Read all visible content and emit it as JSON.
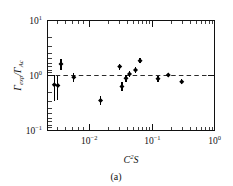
{
  "figure": {
    "caption": "(a)",
    "background_color": "#ffffff",
    "marker_color": "#000000",
    "reference_line_color": "#2b2b2b"
  },
  "chart_data": {
    "type": "scatter",
    "title": "",
    "subtitle": "",
    "xlabel": "C²S",
    "xlabel_parts": {
      "base": "C",
      "sup": "2",
      "tail": "S"
    },
    "ylabel": "Γexp/ΓAc",
    "ylabel_parts": {
      "num_base": "Γ",
      "num_sub": "exp",
      "sep": "/",
      "den_base": "Γ",
      "den_sub": "Ac"
    },
    "xscale": "log",
    "yscale": "log",
    "xlim": [
      0.003,
      1.0
    ],
    "ylim": [
      0.1,
      10.0
    ],
    "grid": false,
    "legend": null,
    "xticks": [
      0.01,
      0.1,
      1.0
    ],
    "xtick_labels": [
      "10-2",
      "10-1",
      "100"
    ],
    "xtick_label_parts": [
      {
        "base": "10",
        "exp": "−2"
      },
      {
        "base": "10",
        "exp": "−1"
      },
      {
        "base": "10",
        "exp": "0"
      }
    ],
    "yticks": [
      0.1,
      1.0,
      10.0
    ],
    "ytick_labels": [
      "10-1",
      "100",
      "101"
    ],
    "ytick_label_parts": [
      {
        "base": "10",
        "exp": "−1"
      },
      {
        "base": "10",
        "exp": "0"
      },
      {
        "base": "10",
        "exp": "1"
      }
    ],
    "reference_lines": [
      {
        "orientation": "horizontal",
        "value": 1.0,
        "style": "dashed"
      }
    ],
    "series": [
      {
        "name": "experimental width ratio",
        "marker": "filled-diamond",
        "points": [
          {
            "x": 0.0038,
            "y": 0.68,
            "yerr_low": 0.33,
            "yerr_high": 0.36
          },
          {
            "x": 0.0043,
            "y": 0.66,
            "yerr_low": 0.3,
            "yerr_high": 0.33
          },
          {
            "x": 0.0048,
            "y": 1.62,
            "yerr_low": 0.36,
            "yerr_high": 0.38
          },
          {
            "x": 0.0075,
            "y": 0.93,
            "yerr_low": 0.16,
            "yerr_high": 0.17
          },
          {
            "x": 0.019,
            "y": 0.35,
            "yerr_low": 0.06,
            "yerr_high": 0.07
          },
          {
            "x": 0.037,
            "y": 1.45,
            "yerr_low": 0.18,
            "yerr_high": 0.2
          },
          {
            "x": 0.04,
            "y": 0.63,
            "yerr_low": 0.11,
            "yerr_high": 0.12
          },
          {
            "x": 0.046,
            "y": 0.89,
            "yerr_low": 0.12,
            "yerr_high": 0.13
          },
          {
            "x": 0.052,
            "y": 1.07,
            "yerr_low": 0.13,
            "yerr_high": 0.14
          },
          {
            "x": 0.064,
            "y": 1.26,
            "yerr_low": 0.14,
            "yerr_high": 0.15
          },
          {
            "x": 0.075,
            "y": 1.85,
            "yerr_low": 0.18,
            "yerr_high": 0.2
          },
          {
            "x": 0.14,
            "y": 0.87,
            "yerr_low": 0.1,
            "yerr_high": 0.11
          },
          {
            "x": 0.2,
            "y": 1.02,
            "yerr_low": 0.1,
            "yerr_high": 0.11
          },
          {
            "x": 0.32,
            "y": 0.77,
            "yerr_low": 0.08,
            "yerr_high": 0.09
          }
        ]
      }
    ]
  }
}
